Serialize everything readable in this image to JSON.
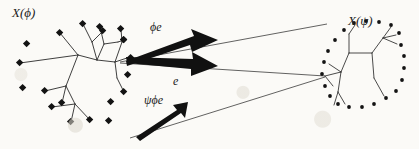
{
  "figure": {
    "title_left": "X(ϕ)",
    "title_right": "X(ψ)",
    "background_color": "#fbfaf7",
    "ink_color": "#1c1c1c",
    "labels": {
      "phi_e": "ϕe",
      "e": "e",
      "psi_phi_e": "ψϕe"
    },
    "left_tree": {
      "name": "X(ϕ)",
      "leaf_marker": "filled-square",
      "leaf_marker_count": 20,
      "internal_nodes": 7,
      "edges_color": "#2a2a2a"
    },
    "right_tree": {
      "name": "X(ψ)",
      "leaf_marker": "filled-dot",
      "leaf_marker_count": 22,
      "internal_nodes": 5,
      "edges_color": "#2a2a2a"
    },
    "thick_arrows": [
      {
        "name": "phi-e-arrow",
        "label": "ϕe",
        "from": [
          127,
          58
        ],
        "to": [
          218,
          40
        ]
      },
      {
        "name": "e-arrow",
        "label": "e",
        "from": [
          127,
          60
        ],
        "to": [
          218,
          66
        ]
      },
      {
        "name": "psi-phi-e-arrow",
        "label": "ψϕe",
        "from": [
          136,
          137
        ],
        "to": [
          186,
          104
        ]
      }
    ],
    "thin_cone_lines": [
      {
        "name": "cone-line-top",
        "from": [
          120,
          62
        ],
        "to": [
          327,
          24
        ]
      },
      {
        "name": "cone-line-middle",
        "from": [
          120,
          63
        ],
        "to": [
          325,
          76
        ]
      },
      {
        "name": "cone-line-bottom",
        "from": [
          130,
          138
        ],
        "to": [
          325,
          77
        ]
      }
    ],
    "convergence_point": [
      325,
      76
    ]
  }
}
